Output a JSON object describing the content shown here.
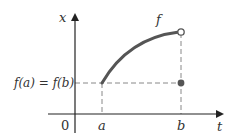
{
  "diagram": {
    "axes": {
      "vertical_label": "x",
      "horizontal_label": "t",
      "origin_label": "0"
    },
    "curve_label": "f",
    "tick_labels": {
      "a": "a",
      "b": "b"
    },
    "level_label": "f(a) = f(b)",
    "points": {
      "start": {
        "label": "(a, f(a))",
        "style": "curve-start"
      },
      "end_open": {
        "label": "(b, limit)",
        "style": "open-circle"
      },
      "end_filled": {
        "label": "(b, f(b))",
        "style": "filled-dot"
      }
    },
    "colors": {
      "curve": "#555555",
      "axis": "#222222",
      "dashed": "#888888",
      "dot": "#555555"
    }
  }
}
